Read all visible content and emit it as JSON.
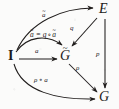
{
  "figure": {
    "kind": "commutative-diagram",
    "caption": "",
    "ink_color": "#201d1c",
    "background_color": "#fbfbfa",
    "objects": [
      {
        "id": "I",
        "label": "I",
        "accent": "",
        "bold": true,
        "x": 10,
        "y": 56
      },
      {
        "id": "Gt",
        "label": "G",
        "accent": "~",
        "bold": false,
        "x": 63,
        "y": 56
      },
      {
        "id": "E",
        "label": "E",
        "accent": "",
        "bold": false,
        "x": 101,
        "y": 9
      },
      {
        "id": "G",
        "label": "G",
        "accent": "",
        "bold": false,
        "x": 101,
        "y": 97
      }
    ],
    "morphisms": [
      {
        "id": "a-tilde-top",
        "from": "I",
        "to": "E",
        "label": "a",
        "accent": "~",
        "style": "curved"
      },
      {
        "id": "a",
        "from": "I",
        "to": "Gt",
        "label": "a",
        "accent": "",
        "style": "straight"
      },
      {
        "id": "q",
        "from": "E",
        "to": "Gt",
        "label": "q",
        "accent": "",
        "style": "straight"
      },
      {
        "id": "p",
        "from": "E",
        "to": "G",
        "label": "p",
        "accent": "",
        "style": "straight"
      },
      {
        "id": "rho",
        "from": "Gt",
        "to": "G",
        "label": "ρ",
        "accent": "",
        "style": "straight"
      },
      {
        "id": "rho-after-a",
        "from": "I",
        "to": "G",
        "label": "ρ ∘ a",
        "accent": "",
        "style": "curved"
      }
    ],
    "equation": {
      "id": "a-equals-q-after-a-tilde",
      "lhs": "a",
      "lhs_accent": "~",
      "relation": "=",
      "rhs": "q ∘ a",
      "rhs_accent": "~",
      "full_text": "ã = q ∘ ã"
    },
    "labels": {
      "a_tilde_top": "a",
      "a_tilde_top_accent": "~",
      "a_horizontal": "a",
      "q": "q",
      "p": "p",
      "rho": "ρ",
      "rho_after_a": "ρ ∘ a",
      "eq_lhs": "a",
      "eq_relation": "=",
      "eq_rhs_q": "q",
      "eq_rhs_circ": "∘",
      "eq_rhs_a": "a"
    },
    "vertex_labels": {
      "I": "I",
      "G_tilde": "G",
      "G_tilde_accent": "~",
      "E": "E",
      "G": "G"
    }
  }
}
